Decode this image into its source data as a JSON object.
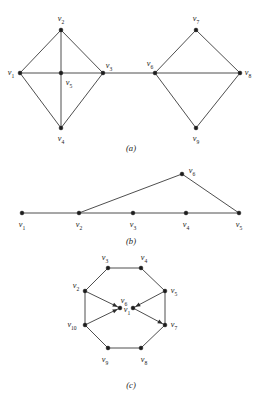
{
  "figure": {
    "background_color": "#ffffff",
    "line_color": "#3a3a3a",
    "vertex_color": "#1d1d1d",
    "captions": {
      "a": "(a)",
      "b": "(b)",
      "c": "(c)"
    },
    "panels": [
      {
        "id": "a",
        "caption": "(a)",
        "description": "Two diamond (K4-like) subgraphs joined by a bridge edge",
        "directed": false,
        "vertices": [
          {
            "name": "v1",
            "label": "v",
            "sub": "1",
            "x": 20,
            "y": 73,
            "label_x": 11,
            "label_y": 73
          },
          {
            "name": "v2",
            "label": "v",
            "sub": "2",
            "x": 61,
            "y": 30,
            "label_x": 61,
            "label_y": 19
          },
          {
            "name": "v3",
            "label": "v",
            "sub": "3",
            "x": 103,
            "y": 73,
            "label_x": 109,
            "label_y": 66
          },
          {
            "name": "v4",
            "label": "v",
            "sub": "4",
            "x": 61,
            "y": 128,
            "label_x": 61,
            "label_y": 139
          },
          {
            "name": "v5",
            "label": "v",
            "sub": "5",
            "x": 61,
            "y": 73,
            "label_x": 69,
            "label_y": 83
          },
          {
            "name": "v6",
            "label": "v",
            "sub": "6",
            "x": 155,
            "y": 73,
            "label_x": 150,
            "label_y": 64
          },
          {
            "name": "v7",
            "label": "v",
            "sub": "7",
            "x": 196,
            "y": 30,
            "label_x": 196,
            "label_y": 19
          },
          {
            "name": "v8",
            "label": "v",
            "sub": "8",
            "x": 240,
            "y": 73,
            "label_x": 248,
            "label_y": 73
          },
          {
            "name": "v9",
            "label": "v",
            "sub": "9",
            "x": 196,
            "y": 128,
            "label_x": 196,
            "label_y": 139
          }
        ],
        "edges": [
          [
            "v1",
            "v2"
          ],
          [
            "v1",
            "v4"
          ],
          [
            "v1",
            "v5"
          ],
          [
            "v2",
            "v3"
          ],
          [
            "v2",
            "v5"
          ],
          [
            "v3",
            "v4"
          ],
          [
            "v3",
            "v5"
          ],
          [
            "v4",
            "v5"
          ],
          [
            "v3",
            "v6"
          ],
          [
            "v6",
            "v7"
          ],
          [
            "v6",
            "v9"
          ],
          [
            "v6",
            "v8"
          ],
          [
            "v7",
            "v8"
          ],
          [
            "v8",
            "v9"
          ]
        ]
      },
      {
        "id": "b",
        "caption": "(b)",
        "description": "Path of five collinear vertices with a sixth vertex above forming a triangle",
        "directed": false,
        "vertices": [
          {
            "name": "v1",
            "label": "v",
            "sub": "1",
            "x": 22,
            "y": 213,
            "label_x": 22,
            "label_y": 225
          },
          {
            "name": "v2",
            "label": "v",
            "sub": "2",
            "x": 79,
            "y": 213,
            "label_x": 79,
            "label_y": 225
          },
          {
            "name": "v3",
            "label": "v",
            "sub": "3",
            "x": 133,
            "y": 213,
            "label_x": 133,
            "label_y": 225
          },
          {
            "name": "v4",
            "label": "v",
            "sub": "4",
            "x": 186,
            "y": 213,
            "label_x": 186,
            "label_y": 225
          },
          {
            "name": "v5",
            "label": "v",
            "sub": "5",
            "x": 239,
            "y": 213,
            "label_x": 239,
            "label_y": 225
          },
          {
            "name": "v6",
            "label": "v",
            "sub": "6",
            "x": 182,
            "y": 174,
            "label_x": 192,
            "label_y": 171
          }
        ],
        "edges": [
          [
            "v1",
            "v2"
          ],
          [
            "v2",
            "v3"
          ],
          [
            "v3",
            "v4"
          ],
          [
            "v4",
            "v5"
          ],
          [
            "v2",
            "v6"
          ],
          [
            "v6",
            "v5"
          ]
        ]
      },
      {
        "id": "c",
        "caption": "(c)",
        "description": "Octagon cycle with two interior vertices joined by directed arrow edges",
        "directed": true,
        "vertices": [
          {
            "name": "v3",
            "label": "v",
            "sub": "3",
            "x": 108,
            "y": 268,
            "label_x": 105,
            "label_y": 258
          },
          {
            "name": "v4",
            "label": "v",
            "sub": "4",
            "x": 141,
            "y": 268,
            "label_x": 144,
            "label_y": 258
          },
          {
            "name": "v2",
            "label": "v",
            "sub": "2",
            "x": 85,
            "y": 291,
            "label_x": 76,
            "label_y": 286
          },
          {
            "name": "v5",
            "label": "v",
            "sub": "5",
            "x": 165,
            "y": 291,
            "label_x": 174,
            "label_y": 291
          },
          {
            "name": "v10",
            "label": "v",
            "sub": "10",
            "x": 85,
            "y": 325,
            "label_x": 72,
            "label_y": 325
          },
          {
            "name": "v7",
            "label": "v",
            "sub": "7",
            "x": 165,
            "y": 325,
            "label_x": 174,
            "label_y": 325
          },
          {
            "name": "v9",
            "label": "v",
            "sub": "9",
            "x": 108,
            "y": 348,
            "label_x": 105,
            "label_y": 360
          },
          {
            "name": "v8",
            "label": "v",
            "sub": "8",
            "x": 141,
            "y": 348,
            "label_x": 144,
            "label_y": 360
          },
          {
            "name": "v1",
            "label": "v",
            "sub": "1",
            "x": 120,
            "y": 308,
            "label_x": 127,
            "label_y": 310
          },
          {
            "name": "v6",
            "label": "v",
            "sub": "6",
            "x": 133,
            "y": 308,
            "label_x": 124,
            "label_y": 301
          }
        ],
        "cycle_edges": [
          [
            "v3",
            "v4"
          ],
          [
            "v4",
            "v5"
          ],
          [
            "v5",
            "v7"
          ],
          [
            "v7",
            "v8"
          ],
          [
            "v8",
            "v9"
          ],
          [
            "v9",
            "v10"
          ],
          [
            "v10",
            "v2"
          ],
          [
            "v2",
            "v3"
          ]
        ],
        "directed_edges": [
          [
            "v2",
            "v1"
          ],
          [
            "v10",
            "v1"
          ],
          [
            "v5",
            "v6"
          ],
          [
            "v6",
            "v7"
          ]
        ]
      }
    ]
  }
}
